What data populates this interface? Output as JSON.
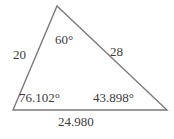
{
  "figure": {
    "kind": "triangle-diagram",
    "stroke_color": "#7a7a7a",
    "text_color": "#3b3b3b",
    "background_color": "#ffffff",
    "vertices": {
      "apex": [
        57,
        6
      ],
      "bottom_left": [
        13,
        110
      ],
      "bottom_right": [
        167,
        110
      ]
    },
    "sides": {
      "left": "20",
      "right": "28",
      "base": "24.980"
    },
    "angles": {
      "top": "60°",
      "bottom_left": "76.102°",
      "bottom_right": "43.898°"
    }
  }
}
